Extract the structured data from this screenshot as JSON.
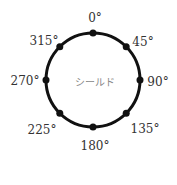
{
  "diagram": {
    "center_label": "シールド",
    "angles": [
      {
        "label": "0°",
        "deg": 0
      },
      {
        "label": "45°",
        "deg": 45
      },
      {
        "label": "90°",
        "deg": 90
      },
      {
        "label": "135°",
        "deg": 135
      },
      {
        "label": "180°",
        "deg": 180
      },
      {
        "label": "225°",
        "deg": 225
      },
      {
        "label": "270°",
        "deg": 270
      },
      {
        "label": "315°",
        "deg": 315
      }
    ]
  }
}
